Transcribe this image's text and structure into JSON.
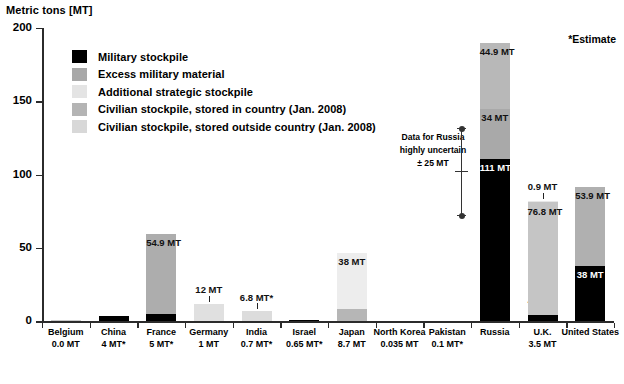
{
  "chart_data": {
    "type": "bar",
    "title": "",
    "ylabel": "Metric tons [MT]",
    "xlabel": "",
    "ylim": [
      0,
      200
    ],
    "yticks": [
      0,
      50,
      100,
      150,
      200
    ],
    "grid": false,
    "stacked": true,
    "legend_position": "upper-left-inside",
    "note": "*Estimate",
    "annotation": {
      "line1": "Data for Russia",
      "line2": "highly uncertain",
      "line3": "± 25 MT"
    },
    "series": [
      {
        "name": "Military stockpile",
        "color": "#000000"
      },
      {
        "name": "Excess military material",
        "color": "#a8a8a8"
      },
      {
        "name": "Additional strategic stockpile",
        "color": "#e4e4e4"
      },
      {
        "name": "Civilian stockpile, stored in country (Jan. 2008)",
        "color": "#b4b4b4"
      },
      {
        "name": "Civilian stockpile, stored outside country (Jan. 2008)",
        "color": "#d8d8d8"
      }
    ],
    "categories": [
      "Belgium",
      "China",
      "France",
      "Germany",
      "India",
      "Israel",
      "Japan",
      "North Korea",
      "Pakistan",
      "Russia",
      "U.K.",
      "United States"
    ],
    "category_sublabels": [
      "0.0 MT",
      "4 MT*",
      "5 MT*",
      "1 MT",
      "0.7 MT*",
      "0.65 MT*",
      "8.7 MT",
      "0.035 MT",
      "0.1 MT*",
      "",
      "3.5 MT",
      ""
    ],
    "bars": [
      {
        "category": "Belgium",
        "total": 0.0,
        "segments": [
          {
            "series": "Civilian stockpile, stored in country (Jan. 2008)",
            "value": 0.6,
            "label": "",
            "color": "#c9c9c9"
          }
        ]
      },
      {
        "category": "China",
        "total": 4.0,
        "segments": [
          {
            "series": "Military stockpile",
            "value": 4.0,
            "label": "",
            "color": "#000000"
          }
        ]
      },
      {
        "category": "France",
        "total": 59.9,
        "segments": [
          {
            "series": "Military stockpile",
            "value": 5.0,
            "label": "",
            "color": "#000000"
          },
          {
            "series": "Excess military material",
            "value": 54.9,
            "label": "54.9 MT",
            "color": "#adadad"
          }
        ]
      },
      {
        "category": "Germany",
        "total": 12.0,
        "segments": [
          {
            "series": "Civilian stockpile, stored in country (Jan. 2008)",
            "value": 12.0,
            "label": "12 MT",
            "color": "#e0e0e0"
          }
        ]
      },
      {
        "category": "India",
        "total": 6.8,
        "segments": [
          {
            "series": "Civilian stockpile, stored in country (Jan. 2008)",
            "value": 6.8,
            "label": "6.8 MT*",
            "color": "#dcdcdc"
          }
        ]
      },
      {
        "category": "Israel",
        "total": 0.65,
        "segments": [
          {
            "series": "Military stockpile",
            "value": 0.9,
            "label": "",
            "color": "#000000"
          }
        ]
      },
      {
        "category": "Japan",
        "total": 46.7,
        "segments": [
          {
            "series": "Civilian stockpile, stored in country (Jan. 2008)",
            "value": 8.7,
            "label": "",
            "color": "#b6b6b6"
          },
          {
            "series": "Civilian stockpile, stored outside country (Jan. 2008)",
            "value": 38.0,
            "label": "38 MT",
            "color": "#ededed"
          }
        ]
      },
      {
        "category": "North Korea",
        "total": 0.035,
        "segments": []
      },
      {
        "category": "Pakistan",
        "total": 0.1,
        "segments": []
      },
      {
        "category": "Russia",
        "total": 189.9,
        "segments": [
          {
            "series": "Military stockpile",
            "value": 111.0,
            "label": "111 MT*",
            "color": "#000000"
          },
          {
            "series": "Excess military material",
            "value": 34.0,
            "label": "34 MT",
            "color": "#a9a9a9"
          },
          {
            "series": "Additional strategic stockpile",
            "value": 44.9,
            "label": "44.9 MT",
            "color": "#b8b8b8"
          }
        ]
      },
      {
        "category": "U.K.",
        "total": 82.1,
        "segments": [
          {
            "series": "Military stockpile",
            "value": 4.4,
            "label": "4.4 MT",
            "color": "#000000"
          },
          {
            "series": "Civilian stockpile, stored in country (Jan. 2008)",
            "value": 76.8,
            "label": "76.8 MT",
            "color": "#c5c5c5"
          },
          {
            "series": "Civilian stockpile, stored outside country (Jan. 2008)",
            "value": 0.9,
            "label": "0.9 MT",
            "color": "#e8e8e8"
          }
        ]
      },
      {
        "category": "United States",
        "total": 91.9,
        "segments": [
          {
            "series": "Military stockpile",
            "value": 38.0,
            "label": "38 MT",
            "color": "#000000"
          },
          {
            "series": "Excess military material",
            "value": 53.9,
            "label": "53.9 MT",
            "color": "#b0b0b0"
          }
        ]
      }
    ]
  }
}
